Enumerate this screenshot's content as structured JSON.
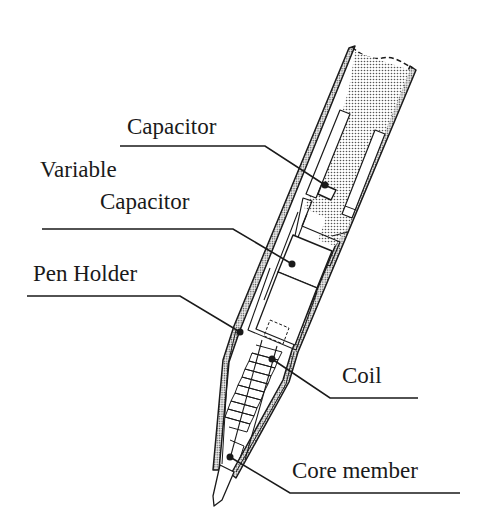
{
  "diagram": {
    "type": "technical-cross-section",
    "colors": {
      "stroke": "#1a1a1a",
      "fill_dotted": "#c8c8c8",
      "background": "#ffffff"
    },
    "labels": [
      {
        "id": "capacitor",
        "text": "Capacitor",
        "x": 127,
        "y": 115
      },
      {
        "id": "variable-capacitor-line1",
        "text": "Variable",
        "x": 40,
        "y": 158
      },
      {
        "id": "variable-capacitor-line2",
        "text": "Capacitor",
        "x": 100,
        "y": 190
      },
      {
        "id": "pen-holder",
        "text": "Pen Holder",
        "x": 33,
        "y": 262
      },
      {
        "id": "coil",
        "text": "Coil",
        "x": 342,
        "y": 360
      },
      {
        "id": "core-member",
        "text": "Core member",
        "x": 292,
        "y": 455
      }
    ],
    "leaders": [
      {
        "id": "capacitor",
        "points": [
          [
            120,
            146
          ],
          [
            265,
            146
          ],
          [
            325,
            185
          ]
        ]
      },
      {
        "id": "variable-capacitor",
        "points": [
          [
            42,
            229
          ],
          [
            233,
            229
          ],
          [
            292,
            264
          ]
        ]
      },
      {
        "id": "pen-holder",
        "points": [
          [
            27,
            296
          ],
          [
            180,
            296
          ],
          [
            240,
            332
          ]
        ]
      },
      {
        "id": "coil",
        "points": [
          [
            272,
            359
          ],
          [
            330,
            398
          ],
          [
            418,
            398
          ]
        ]
      },
      {
        "id": "core-member",
        "points": [
          [
            230,
            457
          ],
          [
            290,
            493
          ],
          [
            460,
            493
          ]
        ]
      }
    ]
  }
}
